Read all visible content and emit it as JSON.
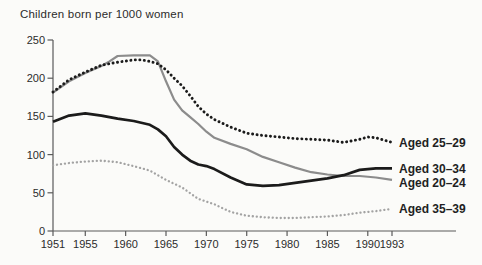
{
  "title": "Children born per 1000 women",
  "colors": {
    "background": "#fbfbf9",
    "axis": "#5a5a5a",
    "tick_text": "#2b2b2b",
    "legend_text": "#1f1f23",
    "series_dark": "#1b1b1b",
    "series_gray": "#8c8c8c",
    "series_light_gray": "#a3a3a3"
  },
  "chart_data": {
    "type": "line",
    "title": "Children born per 1000 women",
    "xlabel": "",
    "ylabel": "Children born per 1000 women",
    "x_axis": {
      "range": [
        1951,
        1993
      ],
      "ticks": [
        1951,
        1955,
        1960,
        1965,
        1970,
        1975,
        1980,
        1985,
        1990,
        1993
      ]
    },
    "y_axis": {
      "range": [
        0,
        250
      ],
      "ticks": [
        0,
        50,
        100,
        150,
        200,
        250
      ]
    },
    "grid": false,
    "legend_position": "right-end-labels",
    "series": [
      {
        "name": "Aged 35–39",
        "style": "dotted",
        "color": "#a3a3a3",
        "points": [
          [
            1951,
            86
          ],
          [
            1953,
            89
          ],
          [
            1955,
            91
          ],
          [
            1957,
            92
          ],
          [
            1959,
            90
          ],
          [
            1961,
            85
          ],
          [
            1963,
            79
          ],
          [
            1965,
            67
          ],
          [
            1967,
            57
          ],
          [
            1969,
            42
          ],
          [
            1971,
            35
          ],
          [
            1973,
            25
          ],
          [
            1975,
            20
          ],
          [
            1977,
            18
          ],
          [
            1979,
            17
          ],
          [
            1981,
            17
          ],
          [
            1983,
            18
          ],
          [
            1985,
            19
          ],
          [
            1987,
            21
          ],
          [
            1989,
            24
          ],
          [
            1991,
            26
          ],
          [
            1993,
            29
          ]
        ]
      },
      {
        "name": "Aged 20–24",
        "style": "solid",
        "color": "#8c8c8c",
        "points": [
          [
            1951,
            181
          ],
          [
            1953,
            196
          ],
          [
            1955,
            207
          ],
          [
            1957,
            216
          ],
          [
            1958,
            222
          ],
          [
            1959,
            229
          ],
          [
            1961,
            230
          ],
          [
            1963,
            230
          ],
          [
            1964,
            222
          ],
          [
            1965,
            196
          ],
          [
            1966,
            172
          ],
          [
            1967,
            158
          ],
          [
            1968,
            149
          ],
          [
            1969,
            140
          ],
          [
            1970,
            130
          ],
          [
            1971,
            122
          ],
          [
            1973,
            114
          ],
          [
            1975,
            107
          ],
          [
            1977,
            97
          ],
          [
            1979,
            90
          ],
          [
            1981,
            83
          ],
          [
            1983,
            77
          ],
          [
            1985,
            74
          ],
          [
            1987,
            72
          ],
          [
            1989,
            72
          ],
          [
            1991,
            70
          ],
          [
            1993,
            67
          ]
        ]
      },
      {
        "name": "Aged 30–34",
        "style": "solid",
        "color": "#1b1b1b",
        "points": [
          [
            1951,
            143
          ],
          [
            1953,
            151
          ],
          [
            1955,
            154
          ],
          [
            1957,
            151
          ],
          [
            1959,
            147
          ],
          [
            1961,
            144
          ],
          [
            1963,
            139
          ],
          [
            1964,
            133
          ],
          [
            1965,
            124
          ],
          [
            1966,
            110
          ],
          [
            1967,
            100
          ],
          [
            1968,
            92
          ],
          [
            1969,
            87
          ],
          [
            1970,
            85
          ],
          [
            1971,
            81
          ],
          [
            1973,
            70
          ],
          [
            1975,
            61
          ],
          [
            1977,
            59
          ],
          [
            1979,
            60
          ],
          [
            1981,
            63
          ],
          [
            1983,
            66
          ],
          [
            1985,
            69
          ],
          [
            1987,
            73
          ],
          [
            1989,
            80
          ],
          [
            1991,
            82
          ],
          [
            1993,
            82
          ]
        ]
      },
      {
        "name": "Aged 25–29",
        "style": "dotted",
        "color": "#1b1b1b",
        "points": [
          [
            1951,
            182
          ],
          [
            1953,
            198
          ],
          [
            1955,
            208
          ],
          [
            1957,
            217
          ],
          [
            1959,
            221
          ],
          [
            1961,
            224
          ],
          [
            1962,
            224
          ],
          [
            1963,
            222
          ],
          [
            1964,
            219
          ],
          [
            1965,
            211
          ],
          [
            1966,
            200
          ],
          [
            1967,
            190
          ],
          [
            1968,
            177
          ],
          [
            1969,
            163
          ],
          [
            1970,
            153
          ],
          [
            1971,
            146
          ],
          [
            1973,
            136
          ],
          [
            1975,
            128
          ],
          [
            1977,
            125
          ],
          [
            1979,
            123
          ],
          [
            1981,
            121
          ],
          [
            1983,
            120
          ],
          [
            1985,
            119
          ],
          [
            1987,
            116
          ],
          [
            1989,
            120
          ],
          [
            1990,
            123
          ],
          [
            1991,
            122
          ],
          [
            1993,
            116
          ]
        ]
      }
    ]
  }
}
